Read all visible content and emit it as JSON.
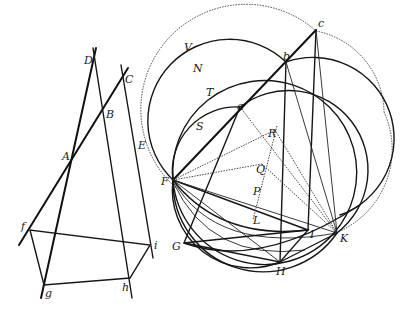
{
  "figure": {
    "left": {
      "labels": {
        "D": "D",
        "C": "C",
        "B": "B",
        "A": "A",
        "E": "E",
        "f": "f",
        "i": "i",
        "g": "g",
        "h": "h"
      }
    },
    "right": {
      "labels": {
        "c": "c",
        "b": "b",
        "a": "a",
        "V": "V",
        "N": "N",
        "T": "T",
        "S": "S",
        "R": "R",
        "Q": "Q",
        "P": "P",
        "L": "L",
        "F": "F",
        "G": "G",
        "H": "H",
        "I": "I",
        "K": "K"
      }
    }
  }
}
